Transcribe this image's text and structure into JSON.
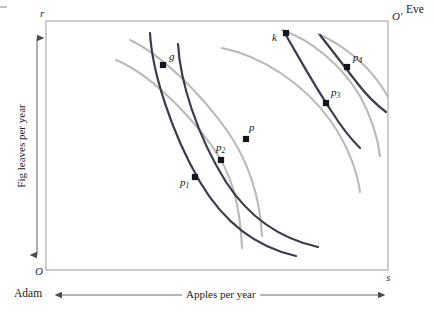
{
  "figure": {
    "type": "edgeworth-box-diagram",
    "background": "#ffffff"
  },
  "box": {
    "origin_adam_label": "O",
    "origin_eve_label": "O'",
    "top_left_axis_label": "r",
    "bottom_right_axis_label": "s",
    "border_color": "#9a9a9a",
    "left": 46,
    "top": 21,
    "right": 388,
    "bottom": 270
  },
  "agents": {
    "lower_left_name": "Adam",
    "upper_right_name": "Eve"
  },
  "axes": {
    "x_title": "Apples per year",
    "y_title": "Fig leaves per year",
    "arrow_color": "#5a5a5a"
  },
  "curves": {
    "adam_color": "#3b3b4b",
    "eve_color": "#b9b9b9",
    "adam_legend": "Adam indifference curve",
    "eve_legend": "Eve indifference curve",
    "adam_count": 4,
    "eve_count": 5
  },
  "points": [
    {
      "id": "g",
      "label": "g",
      "sub": "",
      "x": 163,
      "y": 65,
      "label_x": 169,
      "label_y": 57
    },
    {
      "id": "p1",
      "label": "p",
      "sub": "1",
      "x": 195,
      "y": 177,
      "label_x": 181,
      "label_y": 182
    },
    {
      "id": "p2",
      "label": "p",
      "sub": "2",
      "x": 221,
      "y": 160,
      "label_x": 218,
      "label_y": 147
    },
    {
      "id": "p",
      "label": "p",
      "sub": "",
      "x": 246,
      "y": 139,
      "label_x": 249,
      "label_y": 127
    },
    {
      "id": "k",
      "label": "k",
      "sub": "",
      "x": 286,
      "y": 33,
      "label_x": 274,
      "label_y": 36
    },
    {
      "id": "p3",
      "label": "p",
      "sub": "3",
      "x": 326,
      "y": 103,
      "label_x": 331,
      "label_y": 92
    },
    {
      "id": "p4",
      "label": "p",
      "sub": "4",
      "x": 347,
      "y": 67,
      "label_x": 353,
      "label_y": 57
    }
  ],
  "chart_data": {
    "type": "line",
    "title": "",
    "xlabel": "Apples per year",
    "ylabel": "Fig leaves per year",
    "legend": [
      "Adam indifference curve",
      "Eve indifference curve"
    ],
    "xlim": [
      46,
      388
    ],
    "ylim": [
      270,
      21
    ],
    "grid": false,
    "annotations": [
      "O",
      "O'",
      "r",
      "s",
      "Adam",
      "Eve",
      "g",
      "p1",
      "p2",
      "p",
      "k",
      "p3",
      "p4"
    ],
    "series": [
      {
        "name": "adam-curve-1",
        "owner": "Adam",
        "color": "#3b3b4b",
        "path": "M 150 33 C 152 70, 170 130, 200 182 C 226 226, 260 248, 296 256"
      },
      {
        "name": "adam-curve-2",
        "owner": "Adam",
        "color": "#3b3b4b",
        "path": "M 178 44 C 180 80, 196 134, 226 182 C 252 222, 286 240, 318 247"
      },
      {
        "name": "adam-curve-3",
        "owner": "Adam",
        "color": "#3b3b4b",
        "path": "M 284 32 C 296 52, 312 82, 332 112 C 342 128, 352 140, 360 148"
      },
      {
        "name": "adam-curve-4",
        "owner": "Adam",
        "color": "#3b3b4b",
        "path": "M 320 35 C 330 48, 344 66, 358 84 C 368 97, 378 106, 386 112"
      },
      {
        "name": "eve-curve-1",
        "owner": "Eve",
        "color": "#b9b9b9",
        "path": "M 116 60 C 146 72, 184 108, 212 146 C 232 174, 240 204, 242 248"
      },
      {
        "name": "eve-curve-2",
        "owner": "Eve",
        "color": "#b9b9b9",
        "path": "M 130 40 C 160 54, 200 92, 228 132 C 250 164, 260 198, 262 236"
      },
      {
        "name": "eve-curve-3",
        "owner": "Eve",
        "color": "#b9b9b9",
        "path": "M 222 48 C 262 56, 304 84, 330 120 C 350 148, 358 176, 360 192"
      },
      {
        "name": "eve-curve-4",
        "owner": "Eve",
        "color": "#b9b9b9",
        "path": "M 282 30 C 312 40, 342 66, 360 96 C 372 118, 378 140, 380 156"
      },
      {
        "name": "eve-curve-5",
        "owner": "Eve",
        "color": "#b9b9b9",
        "path": "M 318 34 C 342 44, 366 64, 380 84 C 388 96, 392 104, 394 110"
      }
    ]
  }
}
